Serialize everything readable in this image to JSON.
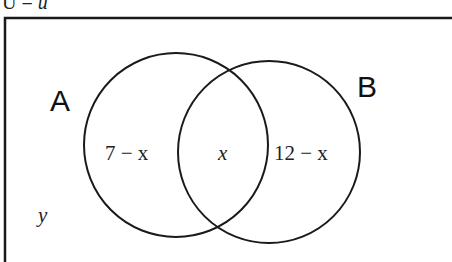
{
  "diagram": {
    "type": "venn",
    "universal_set": {
      "label_prefix": "U = ",
      "label_var": "u"
    },
    "sets": [
      {
        "name": "A",
        "cx": 176,
        "cy": 145,
        "r": 92
      },
      {
        "name": "B",
        "cx": 269,
        "cy": 152,
        "r": 91
      }
    ],
    "regions": {
      "a_only": "7 − x",
      "a_and_b": "x",
      "b_only": "12 − x",
      "outside": "y"
    },
    "colors": {
      "stroke": "#1a1a1a",
      "background": "#ffffff",
      "text": "#222222"
    }
  }
}
